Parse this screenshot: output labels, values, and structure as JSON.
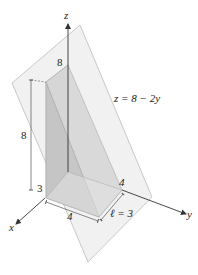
{
  "figure": {
    "axes": {
      "x_label": "x",
      "y_label": "y",
      "z_label": "z"
    },
    "plane_equation": "z = 8 − 2y",
    "dimension_labels": {
      "top_height": "8",
      "left_height": "8",
      "left_base": "3",
      "front_width": "4",
      "right_width": "4",
      "length": "ℓ = 3"
    },
    "colors": {
      "plane_fill": "#efefef",
      "plane_edge": "#b8b8b8",
      "solid_front": "#c9c9c9",
      "solid_side": "#d9d9d9",
      "solid_top": "#e2e2e2",
      "axis": "#333333"
    }
  }
}
